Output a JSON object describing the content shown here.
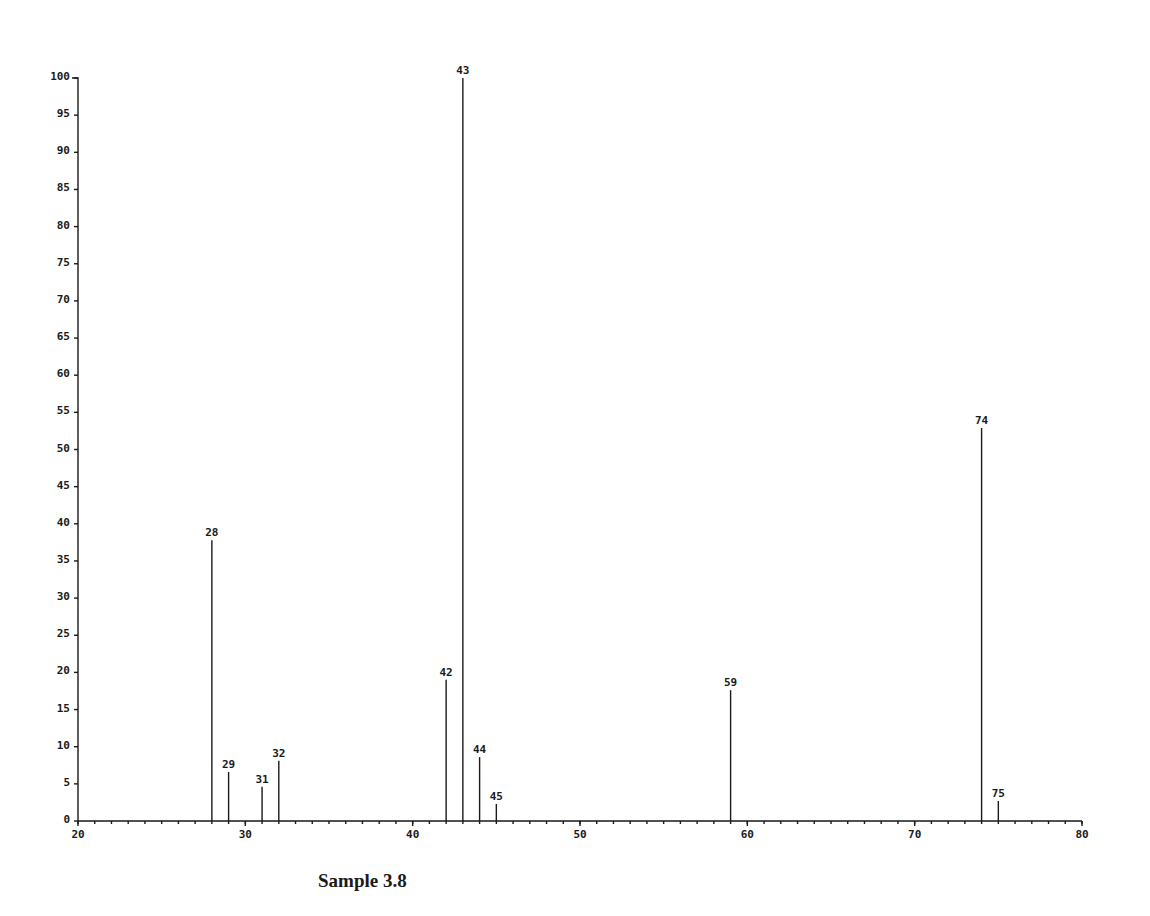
{
  "caption": "Sample 3.8",
  "chart_data": {
    "type": "bar",
    "title": "",
    "subtitle": "",
    "xlabel": "",
    "ylabel": "",
    "xlim": [
      20,
      80
    ],
    "ylim": [
      0,
      100
    ],
    "grid": false,
    "legend": null,
    "x_ticks": [
      20,
      30,
      40,
      50,
      60,
      70,
      80
    ],
    "x_tick_labels": [
      "20",
      "30",
      "40",
      "50",
      "60",
      "70",
      "80"
    ],
    "x_minor_tick_step": 1,
    "y_ticks": [
      0,
      5,
      10,
      15,
      20,
      25,
      30,
      35,
      40,
      45,
      50,
      55,
      60,
      65,
      70,
      75,
      80,
      85,
      90,
      95,
      100
    ],
    "y_tick_labels": [
      "0",
      "5",
      "10",
      "15",
      "20",
      "25",
      "30",
      "35",
      "40",
      "45",
      "50",
      "55",
      "60",
      "65",
      "70",
      "75",
      "80",
      "85",
      "90",
      "95",
      "100"
    ],
    "categories": [
      28,
      29,
      31,
      32,
      42,
      43,
      44,
      45,
      59,
      74,
      75
    ],
    "values": [
      37.8,
      6.6,
      4.6,
      8.1,
      19.0,
      100,
      8.6,
      2.3,
      17.6,
      52.9,
      2.7
    ],
    "peak_labels": [
      "28",
      "29",
      "31",
      "32",
      "42",
      "43",
      "44",
      "45",
      "59",
      "74",
      "75"
    ]
  },
  "colors": {
    "ink": "#1a1a1a",
    "background": "#ffffff"
  }
}
